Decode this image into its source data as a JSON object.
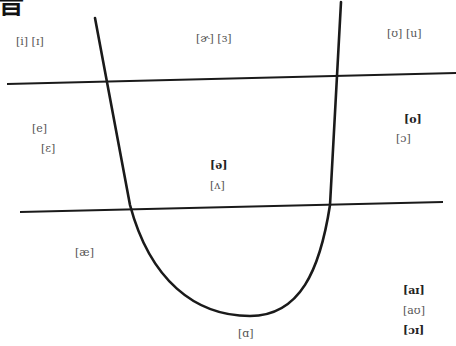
{
  "title": {
    "glyph": "音"
  },
  "colors": {
    "line": "#1a1a1a",
    "symbol": "#555555",
    "symbol_bold": "#222222",
    "background": "#ffffff"
  },
  "diagram": {
    "curve": {
      "description": "U-shaped tongue-position curve",
      "left_top": [
        95,
        18
      ],
      "bottom": [
        250,
        316
      ],
      "right_top": [
        341,
        2
      ]
    },
    "lines": [
      {
        "name": "upper-divider",
        "from": [
          7,
          84
        ],
        "to": [
          456,
          73
        ]
      },
      {
        "name": "lower-divider",
        "from": [
          20,
          212
        ],
        "to": [
          443,
          202
        ]
      }
    ]
  },
  "symbols": {
    "front_high": "[i] [ɪ]",
    "central_high": "[ɚ] [ɜ]",
    "back_high": "[ʊ] [u]",
    "front_mid_1": "[e]",
    "front_mid_2": "[ɛ]",
    "back_mid_1": "[o]",
    "back_mid_2": "[ɔ]",
    "central_mid_1": "[ə]",
    "central_mid_2": "[ʌ]",
    "front_low": "[æ]",
    "low": "[ɑ]",
    "diph_1": "[aɪ]",
    "diph_2": "[aʊ]",
    "diph_3": "[ɔɪ]"
  }
}
